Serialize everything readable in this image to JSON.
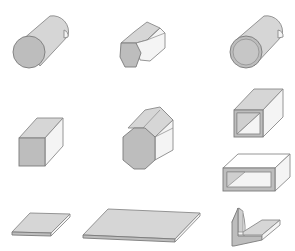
{
  "diagram": {
    "colors": {
      "front_face": "#bdbdbd",
      "top_face": "#d6d6d6",
      "side_face": "#f4f4f4",
      "outline": "#7a7a7a",
      "background": "#ffffff"
    },
    "shapes": [
      {
        "id": "round-bar",
        "label": "Round bar",
        "row": 1,
        "col": 1
      },
      {
        "id": "hex-bar",
        "label": "Hexagonal bar",
        "row": 1,
        "col": 2
      },
      {
        "id": "round-tube",
        "label": "Round tube",
        "row": 1,
        "col": 3
      },
      {
        "id": "square-bar",
        "label": "Square bar",
        "row": 2,
        "col": 1
      },
      {
        "id": "octagon-bar",
        "label": "Octagonal bar",
        "row": 2,
        "col": 2
      },
      {
        "id": "square-tube",
        "label": "Square tube",
        "row": 2,
        "col": 3
      },
      {
        "id": "rectangular-tube",
        "label": "Rectangular tube",
        "row": 3,
        "col": 3
      },
      {
        "id": "plate-small",
        "label": "Flat plate",
        "row": 4,
        "col": 1
      },
      {
        "id": "sheet-large",
        "label": "Sheet",
        "row": 4,
        "col": 2
      },
      {
        "id": "angle",
        "label": "Angle",
        "row": 4,
        "col": 3
      }
    ]
  }
}
